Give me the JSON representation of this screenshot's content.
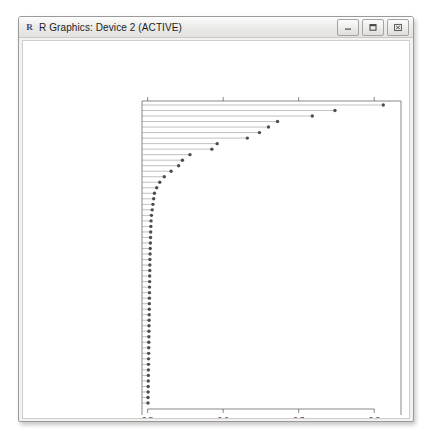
{
  "window": {
    "title": "R Graphics: Device 2 (ACTIVE)",
    "app_glyph": "R",
    "buttons": [
      {
        "name": "minimize-button",
        "label": "–"
      },
      {
        "name": "maximize-button",
        "label": "□"
      },
      {
        "name": "close-button",
        "label": "✕"
      }
    ]
  },
  "chart_data": {
    "type": "bar",
    "subtype": "dotchart",
    "title": "",
    "xlabel": "Importance",
    "ylabel": "",
    "xlim": [
      0.4925,
      0.8275
    ],
    "xticks": [
      0.5,
      0.6,
      0.7,
      0.8
    ],
    "xtick_labels": [
      "0.5",
      "0.6",
      "0.7",
      "0.8"
    ],
    "grid": false,
    "legend": null,
    "orientation": "horizontal",
    "point_color": "#4d4d4d",
    "line_color": "#8c8c8c",
    "categories": [
      "age",
      "id",
      "location",
      "shortnessofbreath",
      "from_wuhan",
      "country",
      "vis_wuhan",
      "recov",
      "gender",
      "hosp_vis",
      "vomiting",
      "sym_on",
      "pneumonia",
      "sorethroat",
      "fever",
      "headache",
      "malaise",
      "chills",
      "myalgia",
      "cold",
      "cough",
      "difficultybreathing",
      "sputum",
      "runnynose",
      "fatigue",
      "jointpain",
      "diarrhea",
      "chestdiscomfort",
      "throatdiscomfort",
      "breathlessness",
      "nasaldischarge",
      "tired",
      "throatpain",
      "muscle pain",
      "muscleaches",
      "nausea",
      "lossofappetite",
      "chestpain",
      "respiratorydistress",
      "itchythroat",
      "mildcough",
      "reflux",
      "thirst",
      "highfever",
      "flu",
      "achingmuscles",
      "sorebody",
      "heavyhead",
      "physicaldiscomfort",
      "dyspnea",
      "mildfever",
      "abdominalpain",
      "sneeze",
      "coughwithsputum",
      "musclecramps"
    ],
    "values": [
      0.812,
      0.748,
      0.718,
      0.672,
      0.66,
      0.648,
      0.632,
      0.592,
      0.585,
      0.556,
      0.546,
      0.541,
      0.531,
      0.522,
      0.516,
      0.512,
      0.509,
      0.508,
      0.507,
      0.506,
      0.505,
      0.5045,
      0.5042,
      0.504,
      0.5038,
      0.5036,
      0.5034,
      0.5032,
      0.503,
      0.5029,
      0.5028,
      0.5027,
      0.5026,
      0.5025,
      0.5024,
      0.5023,
      0.5022,
      0.5021,
      0.502,
      0.5019,
      0.5018,
      0.5017,
      0.5016,
      0.5015,
      0.5014,
      0.5013,
      0.5012,
      0.5011,
      0.501,
      0.5009,
      0.5008,
      0.5007,
      0.5006,
      0.5005,
      0.5004
    ]
  }
}
